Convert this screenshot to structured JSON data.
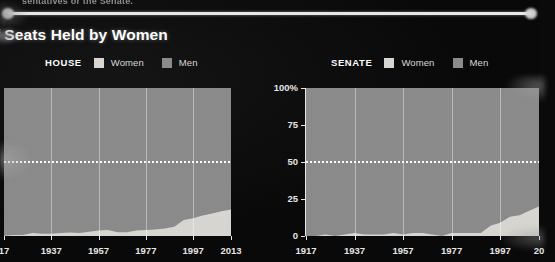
{
  "page": {
    "top_caption": "sentatives or the Senate.",
    "headline": "e of Seats Held by Women",
    "background_color": "#080808"
  },
  "colors": {
    "women": "#d8d7d2",
    "men": "#8b8b8b",
    "axis": "#e8e8e8",
    "grid": "#ffffff",
    "text": "#ffffff"
  },
  "legends": {
    "house": {
      "chamber": "HOUSE",
      "women": "Women",
      "men": "Men"
    },
    "senate": {
      "chamber": "SENATE",
      "women": "Women",
      "men": "Men"
    }
  },
  "chart_data": [
    {
      "type": "area",
      "title": "HOUSE",
      "stacked": true,
      "xlabel": "",
      "ylabel": "",
      "ylim": [
        0,
        100
      ],
      "xlim": [
        1917,
        2013
      ],
      "grid": true,
      "legend_position": "top",
      "yticks": [],
      "ytick_labels": [],
      "xticks": [
        1917,
        1937,
        1957,
        1977,
        1997,
        2013
      ],
      "xtick_labels": [
        "17",
        "1937",
        "1957",
        "1977",
        "1997",
        "2013"
      ],
      "reference_line": {
        "value": 50,
        "style": "dotted",
        "color": "#ffffff"
      },
      "x": [
        1917,
        1921,
        1925,
        1929,
        1933,
        1937,
        1941,
        1945,
        1949,
        1953,
        1957,
        1961,
        1965,
        1969,
        1973,
        1977,
        1981,
        1985,
        1989,
        1993,
        1997,
        2001,
        2005,
        2009,
        2013
      ],
      "series": [
        {
          "name": "Women",
          "values": [
            0.2,
            0.7,
            0.7,
            2.1,
            1.6,
            1.6,
            2.1,
            2.3,
            2.1,
            2.8,
            3.7,
            4.1,
            2.5,
            2.5,
            3.7,
            4.1,
            4.4,
            5.1,
            6.2,
            10.8,
            12.0,
            13.8,
            15.2,
            16.8,
            17.9
          ]
        },
        {
          "name": "Men",
          "values": [
            99.8,
            99.3,
            99.3,
            97.9,
            98.4,
            98.4,
            97.9,
            97.7,
            97.9,
            97.2,
            96.3,
            95.9,
            97.5,
            97.5,
            96.3,
            95.9,
            95.6,
            94.9,
            93.8,
            89.2,
            88.0,
            86.2,
            84.8,
            83.2,
            82.1
          ]
        }
      ]
    },
    {
      "type": "area",
      "title": "SENATE",
      "stacked": true,
      "xlabel": "",
      "ylabel": "",
      "ylim": [
        0,
        100
      ],
      "xlim": [
        1917,
        2013
      ],
      "grid": true,
      "legend_position": "top",
      "yticks": [
        0,
        25,
        50,
        75,
        100
      ],
      "ytick_labels": [
        "0",
        "25",
        "50",
        "75",
        "100%"
      ],
      "xticks": [
        1917,
        1937,
        1957,
        1977,
        1997,
        2013
      ],
      "xtick_labels": [
        "1917",
        "1937",
        "1957",
        "1977",
        "1997",
        "20"
      ],
      "reference_line": {
        "value": 50,
        "style": "dotted",
        "color": "#ffffff"
      },
      "x": [
        1917,
        1921,
        1925,
        1929,
        1933,
        1937,
        1941,
        1945,
        1949,
        1953,
        1957,
        1961,
        1965,
        1969,
        1973,
        1977,
        1981,
        1985,
        1989,
        1993,
        1997,
        2001,
        2005,
        2009,
        2013
      ],
      "series": [
        {
          "name": "Women",
          "values": [
            0,
            0,
            1.0,
            0,
            1.0,
            2.0,
            1.0,
            1.0,
            1.0,
            2.0,
            1.0,
            2.0,
            2.0,
            1.0,
            0,
            2.0,
            2.0,
            2.0,
            2.0,
            7.0,
            9.0,
            13.0,
            14.0,
            17.0,
            20.0
          ]
        },
        {
          "name": "Men",
          "values": [
            100,
            100,
            99,
            100,
            99,
            98,
            99,
            99,
            99,
            98,
            99,
            98,
            98,
            99,
            100,
            98,
            98,
            98,
            98,
            93,
            91,
            87,
            86,
            83,
            80
          ]
        }
      ]
    }
  ]
}
